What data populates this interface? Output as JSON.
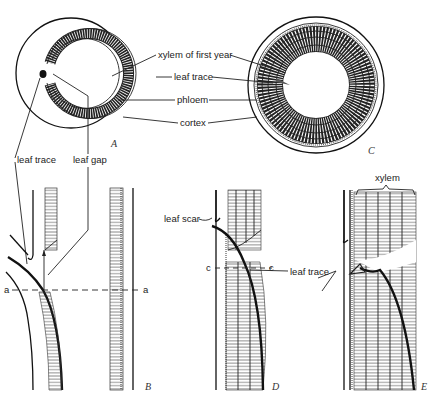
{
  "figure": {
    "panels": [
      {
        "id": "A",
        "label": "A",
        "view": "cross-section",
        "description": "first-year stem cross-section with leaf gap"
      },
      {
        "id": "B",
        "label": "B",
        "view": "longitudinal",
        "description": "longitudinal section through leaf gap, first year"
      },
      {
        "id": "C",
        "label": "C",
        "view": "cross-section",
        "description": "multi-year stem cross-section with buried leaf trace"
      },
      {
        "id": "D",
        "label": "D",
        "view": "longitudinal",
        "description": "longitudinal section after leaf scar forms"
      },
      {
        "id": "E",
        "label": "E",
        "view": "longitudinal",
        "description": "longitudinal section with several years of xylem"
      }
    ],
    "labels": {
      "xylem_first_year": "xylem of first year",
      "leaf_trace": "leaf trace",
      "phloem": "phloem",
      "cortex": "cortex",
      "leaf_trace_left": "leaf trace",
      "leaf_gap": "leaf gap",
      "leaf_scar": "leaf scar",
      "leaf_trace_de": "leaf trace",
      "xylem": "xylem"
    },
    "section_markers": {
      "a_left": "a",
      "a_right": "a",
      "c_left": "c",
      "c_right": "c"
    }
  }
}
